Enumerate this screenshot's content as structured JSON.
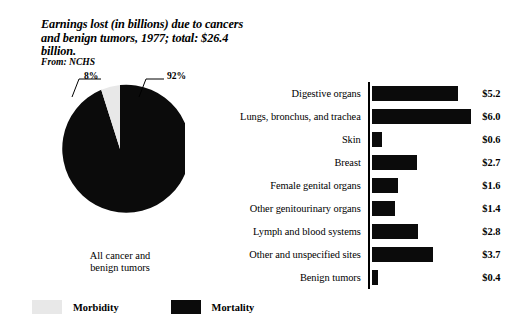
{
  "title": "Earnings lost (in billions) due to cancers and benign tumors, 1977; total: $26.4 billion.",
  "source": "From: NCHS",
  "colors": {
    "mortality": "#0b0b0b",
    "morbidity": "#e8e8e8",
    "background": "#ffffff",
    "axis": "#000000"
  },
  "pie": {
    "caption_line1": "All cancer and",
    "caption_line2": "benign tumors",
    "label_morbidity_pct": "8%",
    "label_mortality_pct": "92%"
  },
  "legend": {
    "items": [
      {
        "label": "Morbidity",
        "color": "#e8e8e8"
      },
      {
        "label": "Mortality",
        "color": "#0b0b0b"
      }
    ]
  },
  "chart_data": [
    {
      "type": "pie",
      "title": "Earnings lost (in billions) due to cancers and benign tumors, 1977; total: $26.4 billion.",
      "subtitle": "All cancer and benign tumors",
      "labels": [
        "Morbidity",
        "Mortality"
      ],
      "values": [
        8,
        92
      ],
      "value_labels": [
        "8%",
        "92%"
      ],
      "unit": "percent",
      "legend_position": "bottom-left",
      "colors": [
        "#e8e8e8",
        "#0b0b0b"
      ]
    },
    {
      "type": "bar",
      "orientation": "horizontal",
      "title": "",
      "xlabel": "",
      "ylabel": "",
      "unit": "billions of dollars",
      "xlim": [
        0,
        6.2
      ],
      "grid": false,
      "categories": [
        "Digestive organs",
        "Lungs, bronchus, and trachea",
        "Skin",
        "Breast",
        "Female genital organs",
        "Other genitourinary organs",
        "Lymph and blood systems",
        "Other and unspecified sites",
        "Benign tumors"
      ],
      "values": [
        5.2,
        6.0,
        0.6,
        2.7,
        1.6,
        1.4,
        2.8,
        3.7,
        0.4
      ],
      "value_labels": [
        "$5.2",
        "$6.0",
        "$0.6",
        "$2.7",
        "$1.6",
        "$1.4",
        "$2.8",
        "$3.7",
        "$0.4"
      ],
      "total": 26.4
    }
  ]
}
